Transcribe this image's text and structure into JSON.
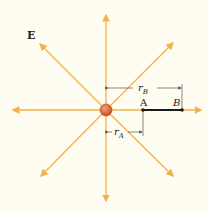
{
  "diagram": {
    "field_label": "E",
    "point_a_label": "A",
    "point_b_label": "B",
    "r_a_label": "r",
    "r_a_sub": "A",
    "r_b_label": "r",
    "r_b_sub": "B",
    "colors": {
      "background": "#fffdf1",
      "field_line": "#f2b24a",
      "charge": "#d9603a",
      "segment": "#1a1a1a",
      "dimension": "#555555"
    }
  }
}
